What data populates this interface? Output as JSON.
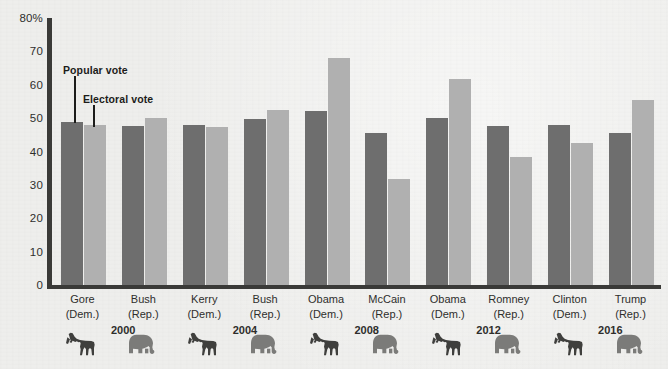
{
  "chart_data": {
    "type": "bar",
    "title": "",
    "xlabel": "",
    "ylabel": "",
    "ylim": [
      0,
      80
    ],
    "grid": false,
    "legend_position": "inline-annotation",
    "y_ticks": [
      "80%",
      "70",
      "60",
      "50",
      "40",
      "30",
      "20",
      "10",
      "0"
    ],
    "y_tick_values": [
      80,
      70,
      60,
      50,
      40,
      30,
      20,
      10,
      0
    ],
    "annotations": [
      {
        "text": "Popular vote",
        "points_to": "Gore popular-vote bar"
      },
      {
        "text": "Electoral vote",
        "points_to": "Gore electoral-vote bar"
      }
    ],
    "series": [
      {
        "name": "Popular vote",
        "color": "#6e6e6e",
        "values": [
          48.9,
          47.7,
          48.0,
          49.8,
          52.2,
          45.6,
          50.1,
          47.7,
          48.0,
          45.6
        ]
      },
      {
        "name": "Electoral vote",
        "color": "#b0b0b0",
        "values": [
          48.0,
          50.1,
          47.4,
          52.5,
          67.9,
          31.7,
          61.6,
          38.3,
          42.6,
          55.3
        ]
      }
    ],
    "categories": [
      {
        "name": "Gore",
        "party": "(Dem.)",
        "icon": "donkey-icon"
      },
      {
        "name": "Bush",
        "party": "(Rep.)",
        "icon": "elephant-icon"
      },
      {
        "name": "Kerry",
        "party": "(Dem.)",
        "icon": "donkey-icon"
      },
      {
        "name": "Bush",
        "party": "(Rep.)",
        "icon": "elephant-icon"
      },
      {
        "name": "Obama",
        "party": "(Dem.)",
        "icon": "donkey-icon"
      },
      {
        "name": "McCain",
        "party": "(Rep.)",
        "icon": "elephant-icon"
      },
      {
        "name": "Obama",
        "party": "(Dem.)",
        "icon": "donkey-icon"
      },
      {
        "name": "Romney",
        "party": "(Rep.)",
        "icon": "elephant-icon"
      },
      {
        "name": "Clinton",
        "party": "(Dem.)",
        "icon": "donkey-icon"
      },
      {
        "name": "Trump",
        "party": "(Rep.)",
        "icon": "elephant-icon"
      }
    ],
    "election_years": [
      "2000",
      "2004",
      "2008",
      "2012",
      "2016"
    ]
  },
  "colors": {
    "background": "#eeeeec",
    "axis": "#3a3a38",
    "popular_vote": "#6e6e6e",
    "electoral_vote": "#b0b0b0",
    "text": "#2e2e2c",
    "donkey": "#3f3f3d",
    "elephant": "#7b7b79"
  }
}
